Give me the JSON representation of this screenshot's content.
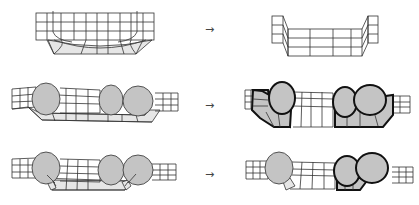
{
  "figure": {
    "arrow_symbol": "→",
    "rows": [
      {
        "id": "row-1",
        "left": "curved-mesh",
        "right": "flattened-mesh",
        "arrow": "→"
      },
      {
        "id": "row-2",
        "left": "mesh-with-three-blobs",
        "right": "mesh-with-highlighted-regions",
        "arrow": "→"
      },
      {
        "id": "row-3",
        "left": "mesh-with-three-blobs-inner-strip",
        "right": "mesh-with-highlighted-pair",
        "arrow": "→"
      }
    ],
    "colors": {
      "line": "#333333",
      "blob_fill": "#c4c4c4",
      "strip_fill": "#e6e6e6",
      "highlight_stroke": "#111111"
    }
  }
}
